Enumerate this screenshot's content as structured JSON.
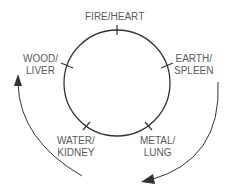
{
  "diagram": {
    "nodes": [
      {
        "id": "fire",
        "line1": "FIRE/HEART",
        "line2": ""
      },
      {
        "id": "earth",
        "line1": "EARTH/",
        "line2": "SPLEEN"
      },
      {
        "id": "metal",
        "line1": "METAL/",
        "line2": "LUNG"
      },
      {
        "id": "water",
        "line1": "WATER/",
        "line2": "KIDNEY"
      },
      {
        "id": "wood",
        "line1": "WOOD/",
        "line2": "LIVER"
      }
    ],
    "colors": {
      "line": "#333333",
      "text": "#5a5a5a",
      "background": "#ffffff"
    }
  }
}
